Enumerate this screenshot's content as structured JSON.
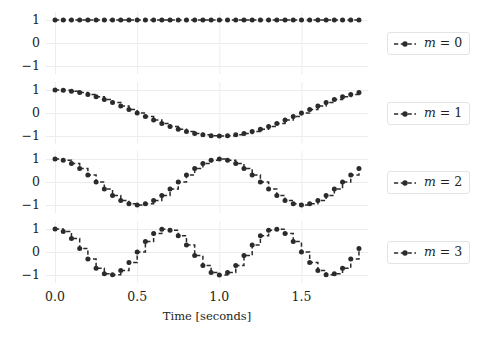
{
  "figure": {
    "background_color": "#ffffff",
    "line_color": "#2b2b2b",
    "grid_color": "#ececec",
    "marker_color": "#2b2b2b"
  },
  "axis": {
    "xlabel": "Time [seconds]",
    "xticks": [
      "0.0",
      "0.5",
      "1.0",
      "1.5"
    ],
    "xtick_values": [
      0.0,
      0.5,
      1.0,
      1.5
    ],
    "yticks": [
      "1",
      "0",
      "−1"
    ],
    "ytick_values": [
      1,
      0,
      -1
    ],
    "xlim": [
      -0.055,
      1.905
    ],
    "ylim": [
      -1.35,
      1.35
    ]
  },
  "legend": {
    "entries": [
      {
        "label_prefix": "m",
        "label_eq": "=",
        "label_value": "0",
        "label": "m = 0"
      },
      {
        "label_prefix": "m",
        "label_eq": "=",
        "label_value": "1",
        "label": "m = 1"
      },
      {
        "label_prefix": "m",
        "label_eq": "=",
        "label_value": "2",
        "label": "m = 2"
      },
      {
        "label_prefix": "m",
        "label_eq": "=",
        "label_value": "3",
        "label": "m = 3"
      }
    ]
  },
  "chart_data": {
    "type": "line",
    "title": "",
    "xlabel": "Time [seconds]",
    "ylabel": "",
    "xlim": [
      -0.055,
      1.905
    ],
    "ylim": [
      -1.35,
      1.35
    ],
    "grid": true,
    "legend_position": "right",
    "drawstyle": "steps",
    "linestyle": "dashed",
    "marker": "circle",
    "subplots": 4,
    "shared_x": true,
    "x": [
      0.0,
      0.05,
      0.1,
      0.15,
      0.2,
      0.25,
      0.3,
      0.35,
      0.4,
      0.45,
      0.5,
      0.55,
      0.6,
      0.65,
      0.7,
      0.75,
      0.8,
      0.85,
      0.9,
      0.95,
      1.0,
      1.05,
      1.1,
      1.15,
      1.2,
      1.25,
      1.3,
      1.35,
      1.4,
      1.45,
      1.5,
      1.55,
      1.6,
      1.65,
      1.7,
      1.75,
      1.8,
      1.85
    ],
    "series": [
      {
        "name": "m = 0",
        "m": 0,
        "formula": "cos(2*pi*0*t)",
        "yticks": [
          1,
          0,
          -1
        ],
        "values": [
          1,
          1,
          1,
          1,
          1,
          1,
          1,
          1,
          1,
          1,
          1,
          1,
          1,
          1,
          1,
          1,
          1,
          1,
          1,
          1,
          1,
          1,
          1,
          1,
          1,
          1,
          1,
          1,
          1,
          1,
          1,
          1,
          1,
          1,
          1,
          1,
          1,
          1
        ]
      },
      {
        "name": "m = 1",
        "m": 1,
        "formula": "cos(2*pi*0.5*t)",
        "yticks": [
          1,
          0,
          -1
        ],
        "values": [
          1.0,
          0.988,
          0.951,
          0.891,
          0.809,
          0.707,
          0.588,
          0.454,
          0.309,
          0.156,
          0.0,
          -0.156,
          -0.309,
          -0.454,
          -0.588,
          -0.707,
          -0.809,
          -0.891,
          -0.951,
          -0.988,
          -1.0,
          -0.988,
          -0.951,
          -0.891,
          -0.809,
          -0.707,
          -0.588,
          -0.454,
          -0.309,
          -0.156,
          0.0,
          0.156,
          0.309,
          0.454,
          0.588,
          0.707,
          0.809,
          0.891
        ]
      },
      {
        "name": "m = 2",
        "m": 2,
        "formula": "cos(2*pi*1*t)",
        "yticks": [
          1,
          0,
          -1
        ],
        "values": [
          1.0,
          0.951,
          0.809,
          0.588,
          0.309,
          0.0,
          -0.309,
          -0.588,
          -0.809,
          -0.951,
          -1.0,
          -0.951,
          -0.809,
          -0.588,
          -0.309,
          0.0,
          0.309,
          0.588,
          0.809,
          0.951,
          1.0,
          0.951,
          0.809,
          0.588,
          0.309,
          0.0,
          -0.309,
          -0.588,
          -0.809,
          -0.951,
          -1.0,
          -0.951,
          -0.809,
          -0.588,
          -0.309,
          0.0,
          0.309,
          0.588
        ]
      },
      {
        "name": "m = 3",
        "m": 3,
        "formula": "cos(2*pi*1.5*t)",
        "yticks": [
          1,
          0,
          -1
        ],
        "values": [
          1.0,
          0.891,
          0.588,
          0.156,
          -0.309,
          -0.707,
          -0.951,
          -0.988,
          -0.809,
          -0.454,
          0.0,
          0.454,
          0.809,
          0.988,
          0.951,
          0.707,
          0.309,
          -0.156,
          -0.588,
          -0.891,
          -1.0,
          -0.891,
          -0.588,
          -0.156,
          0.309,
          0.707,
          0.951,
          0.988,
          0.809,
          0.454,
          0.0,
          -0.454,
          -0.809,
          -0.988,
          -0.951,
          -0.707,
          -0.309,
          0.156
        ]
      }
    ]
  },
  "caption": {
    "text": ""
  }
}
